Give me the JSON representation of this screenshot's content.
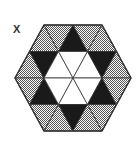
{
  "figure": {
    "label": "X",
    "colors": {
      "black": "#1a1a1a",
      "dotted_fill": "#bdbdbd",
      "dot": "#555555",
      "white": "#ffffff",
      "stroke": "#333333"
    },
    "triangles": [
      {
        "id": "r1-1",
        "fill": "dotted",
        "points": "29.5,51.5 44,25 58.5,51.5"
      },
      {
        "id": "r1-2",
        "fill": "dotted",
        "points": "44,25 73,25 58.5,51.5"
      },
      {
        "id": "r1-3",
        "fill": "black",
        "points": "58.5,51.5 73,25 87.5,51.5"
      },
      {
        "id": "r1-4",
        "fill": "dotted",
        "points": "73,25 102,25 87.5,51.5"
      },
      {
        "id": "r1-5",
        "fill": "dotted",
        "points": "87.5,51.5 102,25 116.5,51.5"
      },
      {
        "id": "r2-1",
        "fill": "dotted",
        "points": "15,78 29.5,51.5 44,78"
      },
      {
        "id": "r2-2",
        "fill": "black",
        "points": "29.5,51.5 58.5,51.5 44,78"
      },
      {
        "id": "r2-3",
        "fill": "white",
        "points": "44,78 58.5,51.5 73,78"
      },
      {
        "id": "r2-4",
        "fill": "white",
        "points": "58.5,51.5 87.5,51.5 73,78"
      },
      {
        "id": "r2-5",
        "fill": "white",
        "points": "73,78 87.5,51.5 102,78"
      },
      {
        "id": "r2-6",
        "fill": "black",
        "points": "87.5,51.5 116.5,51.5 102,78"
      },
      {
        "id": "r2-7",
        "fill": "dotted",
        "points": "102,78 116.5,51.5 131,78"
      },
      {
        "id": "r3-1",
        "fill": "dotted",
        "points": "15,78 44,78 29.5,104.5"
      },
      {
        "id": "r3-2",
        "fill": "black",
        "points": "29.5,104.5 44,78 58.5,104.5"
      },
      {
        "id": "r3-3",
        "fill": "white",
        "points": "44,78 73,78 58.5,104.5"
      },
      {
        "id": "r3-4",
        "fill": "white",
        "points": "58.5,104.5 73,78 87.5,104.5"
      },
      {
        "id": "r3-5",
        "fill": "white",
        "points": "73,78 102,78 87.5,104.5"
      },
      {
        "id": "r3-6",
        "fill": "black",
        "points": "87.5,104.5 102,78 116.5,104.5"
      },
      {
        "id": "r3-7",
        "fill": "dotted",
        "points": "102,78 131,78 116.5,104.5"
      },
      {
        "id": "r4-1",
        "fill": "dotted",
        "points": "29.5,104.5 58.5,104.5 44,131"
      },
      {
        "id": "r4-2",
        "fill": "dotted",
        "points": "44,131 58.5,104.5 73,131"
      },
      {
        "id": "r4-3",
        "fill": "black",
        "points": "58.5,104.5 87.5,104.5 73,131"
      },
      {
        "id": "r4-4",
        "fill": "dotted",
        "points": "73,131 87.5,104.5 102,131"
      },
      {
        "id": "r4-5",
        "fill": "dotted",
        "points": "87.5,104.5 116.5,104.5 102,131"
      }
    ],
    "outline": "44,25 102,25 131,78 102,131 44,131 15,78"
  }
}
